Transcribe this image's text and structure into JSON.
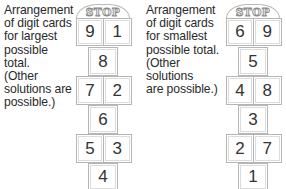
{
  "captions": {
    "largest": "Arrangement\nof digit cards\nfor largest\npossible total.\n(Other\nsolutions are\npossible.)",
    "smallest": "Arrangement\nof digit cards\nfor smallest\npossible total.\n(Other solutions\nare possible.)"
  },
  "hopscotch_largest": {
    "stop_label": "STOP",
    "rows": [
      [
        "9",
        "1"
      ],
      [
        "8"
      ],
      [
        "7",
        "2"
      ],
      [
        "6"
      ],
      [
        "5",
        "3"
      ],
      [
        "4"
      ]
    ]
  },
  "hopscotch_smallest": {
    "stop_label": "STOP",
    "rows": [
      [
        "6",
        "9"
      ],
      [
        "5"
      ],
      [
        "4",
        "8"
      ],
      [
        "3"
      ],
      [
        "2",
        "7"
      ],
      [
        "1"
      ]
    ]
  },
  "colors": {
    "border": "#b5b5b5",
    "text": "#2a2a2a",
    "background": "#ffffff"
  }
}
